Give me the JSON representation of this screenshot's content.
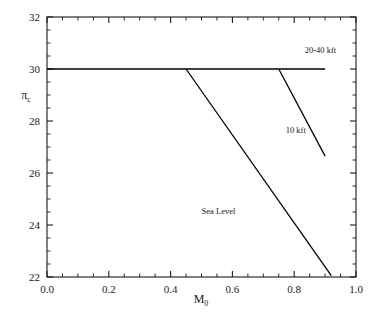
{
  "chart_data": {
    "type": "line",
    "title": "",
    "subtitle": "",
    "xlabel": "M",
    "xlabel_sub": "0",
    "ylabel": "π",
    "ylabel_sub": "c",
    "xlim": [
      0.0,
      1.0
    ],
    "ylim": [
      22,
      32
    ],
    "xticks": [
      "0.0",
      "0.2",
      "0.4",
      "0.6",
      "0.8",
      "1.0"
    ],
    "xtick_values": [
      0.0,
      0.2,
      0.4,
      0.6,
      0.8,
      1.0
    ],
    "yticks": [
      "22",
      "24",
      "26",
      "28",
      "30",
      "32"
    ],
    "ytick_values": [
      22,
      24,
      26,
      28,
      30,
      32
    ],
    "x_minor_interval": 0.05,
    "y_minor_interval": 0.5,
    "grid": false,
    "legend": "inline-annotations",
    "series": [
      {
        "name": "20-40 kft",
        "label": "20-40 kft",
        "label_x": 0.885,
        "label_y": 30.62,
        "x": [
          0.0,
          0.45,
          0.75,
          0.9
        ],
        "y": [
          30.0,
          30.0,
          30.0,
          30.0
        ]
      },
      {
        "name": "10 kft",
        "label": "10 kft",
        "label_x": 0.805,
        "label_y": 27.55,
        "x": [
          0.75,
          0.9
        ],
        "y": [
          30.0,
          26.65
        ]
      },
      {
        "name": "Sea Level",
        "label": "Sea Level",
        "label_x": 0.555,
        "label_y": 24.42,
        "x": [
          0.45,
          0.92
        ],
        "y": [
          30.0,
          22.05
        ]
      }
    ],
    "annotations": [
      {
        "text": "20-40 kft",
        "x": 0.885,
        "y": 30.62
      },
      {
        "text": "10 kft",
        "x": 0.805,
        "y": 27.55
      },
      {
        "text": "Sea Level",
        "x": 0.555,
        "y": 24.42
      }
    ]
  }
}
